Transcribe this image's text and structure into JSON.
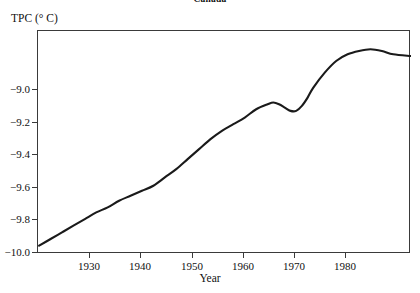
{
  "chart_data": {
    "type": "line",
    "title": "Canada",
    "xlabel": "Year",
    "ylabel": "TPC (° C)",
    "xlim": [
      1919.8,
      1985.1
    ],
    "ylim": [
      -10.12,
      -8.78
    ],
    "grid": false,
    "legend": "none",
    "line_color": "#1a1a1a",
    "x_ticks": [
      1930,
      1940,
      1950,
      1960,
      1970,
      1980
    ],
    "x_tick_labels": [
      "1930",
      "1940",
      "1950",
      "1960",
      "1970",
      "1980"
    ],
    "y_ticks": [
      -9.0,
      -9.2,
      -9.4,
      -9.6,
      -9.8,
      -10.0
    ],
    "y_tick_labels": [
      "−9.0",
      "−9.2",
      "−9.4",
      "−9.6",
      "−9.8",
      "−10.0"
    ],
    "series": [
      {
        "name": "TPC",
        "x": [
          1920,
          1922,
          1924,
          1926,
          1928,
          1930,
          1932,
          1934,
          1936,
          1938,
          1940,
          1942,
          1944,
          1946,
          1948,
          1950,
          1952,
          1954,
          1956,
          1958,
          1960,
          1961,
          1962,
          1963,
          1964,
          1965,
          1966,
          1967,
          1968,
          1970,
          1972,
          1974,
          1976,
          1978,
          1980,
          1982,
          1985
        ],
        "y": [
          -10.07,
          -10.03,
          -9.99,
          -9.95,
          -9.91,
          -9.87,
          -9.84,
          -9.8,
          -9.77,
          -9.74,
          -9.71,
          -9.66,
          -9.61,
          -9.55,
          -9.49,
          -9.43,
          -9.38,
          -9.34,
          -9.3,
          -9.25,
          -9.22,
          -9.21,
          -9.22,
          -9.24,
          -9.26,
          -9.26,
          -9.23,
          -9.18,
          -9.12,
          -9.03,
          -8.96,
          -8.92,
          -8.9,
          -8.89,
          -8.9,
          -8.92,
          -8.93
        ]
      }
    ],
    "annotations": [
      {
        "label": "local maximum",
        "x": 1961,
        "y": -9.21
      },
      {
        "label": "local minimum",
        "x": 1964.5,
        "y": -9.26
      },
      {
        "label": "global maximum",
        "x": 1978,
        "y": -8.89
      },
      {
        "label": "start",
        "x": 1920,
        "y": -10.07
      },
      {
        "label": "end",
        "x": 1985,
        "y": -8.93
      }
    ]
  },
  "axes": {
    "y_tick_entries": [
      {
        "label": "−9.0",
        "top": 59
      },
      {
        "label": "−9.2",
        "top": 92
      },
      {
        "label": "−9.4",
        "top": 124
      },
      {
        "label": "−9.6",
        "top": 157
      },
      {
        "label": "−9.8",
        "top": 189
      },
      {
        "label": "−10.0",
        "top": 222
      }
    ],
    "x_tick_entries": [
      {
        "label": "1930",
        "left": 89
      },
      {
        "label": "1940",
        "left": 140
      },
      {
        "label": "1950",
        "left": 192
      },
      {
        "label": "1960",
        "left": 243
      },
      {
        "label": "1970",
        "left": 294
      },
      {
        "label": "1980",
        "left": 345
      }
    ]
  }
}
